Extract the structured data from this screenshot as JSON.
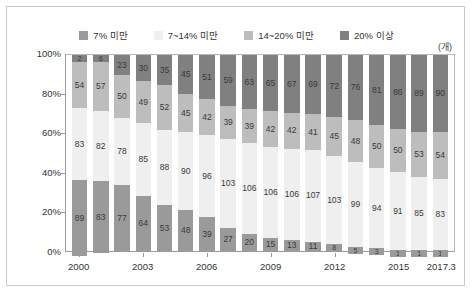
{
  "chart_data": {
    "type": "bar",
    "stacked": true,
    "stacked_mode": "percent",
    "title": "",
    "subtitle": "",
    "xlabel": "",
    "ylabel": "",
    "unit_label": "(개)",
    "ylim": [
      0,
      100
    ],
    "ytick_labels": [
      "0%",
      "20%",
      "40%",
      "60%",
      "80%",
      "100%"
    ],
    "ytick_values": [
      0,
      20,
      40,
      60,
      80,
      100
    ],
    "grid": false,
    "legend_position": "top-center",
    "categories": [
      "2000",
      "2001",
      "2002",
      "2003",
      "2004",
      "2005",
      "2006",
      "2007",
      "2008",
      "2009",
      "2010",
      "2011",
      "2012",
      "2013",
      "2014",
      "2015",
      "2016",
      "2017.3"
    ],
    "xtick_labels": [
      "2000",
      "2003",
      "2006",
      "2009",
      "2012",
      "2015",
      "2017.3"
    ],
    "xtick_indices": [
      0,
      3,
      6,
      9,
      12,
      15,
      17
    ],
    "series": [
      {
        "name": "7% 미만",
        "color": "#9a9a9a",
        "values": [
          89,
          83,
          77,
          64,
          53,
          48,
          39,
          27,
          20,
          15,
          13,
          11,
          8,
          5,
          3,
          1,
          1,
          1
        ]
      },
      {
        "name": "7~14% 미만",
        "color": "#efefef",
        "values": [
          83,
          82,
          78,
          85,
          88,
          90,
          96,
          103,
          106,
          106,
          106,
          107,
          103,
          99,
          94,
          91,
          85,
          83
        ]
      },
      {
        "name": "14~20% 미만",
        "color": "#bdbdbd",
        "values": [
          54,
          57,
          50,
          49,
          52,
          45,
          42,
          39,
          39,
          42,
          42,
          41,
          45,
          48,
          50,
          50,
          53,
          54
        ]
      },
      {
        "name": "20% 이상",
        "color": "#808080",
        "values": [
          2,
          6,
          23,
          30,
          35,
          45,
          51,
          59,
          63,
          65,
          67,
          69,
          72,
          76,
          81,
          86,
          89,
          90
        ]
      }
    ]
  }
}
